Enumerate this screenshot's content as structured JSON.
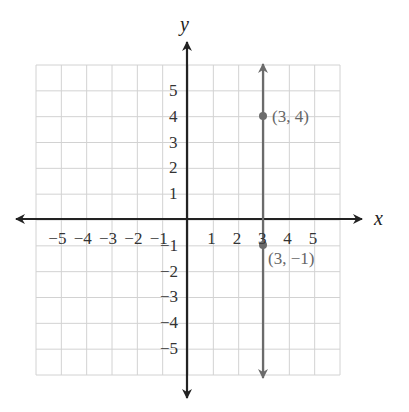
{
  "chart_data": {
    "type": "line",
    "title": "",
    "xlabel": "x",
    "ylabel": "y",
    "xlim": [
      -6,
      6
    ],
    "ylim": [
      -6,
      6
    ],
    "grid": true,
    "x_ticks": [
      "-5",
      "-4",
      "-3",
      "-2",
      "-1",
      "1",
      "2",
      "3",
      "4",
      "5"
    ],
    "y_ticks": [
      "5",
      "4",
      "3",
      "2",
      "1",
      "-1",
      "-2",
      "-3",
      "-4",
      "-5"
    ],
    "series": [
      {
        "name": "x = 3",
        "type": "vertical_line",
        "x": 3,
        "color": "#666666"
      }
    ],
    "points": [
      {
        "x": 3,
        "y": 4,
        "label": "(3, 4)"
      },
      {
        "x": 3,
        "y": -1,
        "label": "(3, −1)"
      }
    ]
  },
  "labels": {
    "x_axis": "x",
    "y_axis": "y",
    "x_ticks": [
      "−5",
      "−4",
      "−3",
      "−2",
      "−1",
      "1",
      "2",
      "3",
      "4",
      "5"
    ],
    "y_ticks_pos": [
      "5",
      "4",
      "3",
      "2",
      "1"
    ],
    "y_ticks_neg": [
      "−1",
      "−2",
      "−3",
      "−4",
      "−5"
    ],
    "point_a": "(3, 4)",
    "point_b": "(3, −1)"
  },
  "colors": {
    "axis": "#222222",
    "line": "#6b6b6b",
    "grid": "#cfcfcf"
  }
}
